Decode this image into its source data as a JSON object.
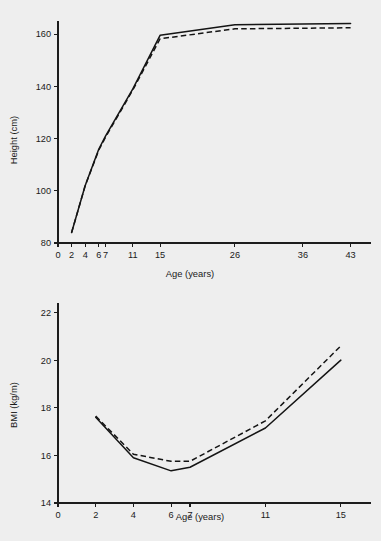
{
  "page": {
    "background_color": "#eeeeee",
    "ink_color": "#141414",
    "width": 381,
    "height": 541
  },
  "chart_data": [
    {
      "id": "height-chart",
      "type": "line",
      "title": "",
      "xlabel": "Age (years)",
      "ylabel": "Height (cm)",
      "xlim": [
        0,
        46
      ],
      "ylim": [
        80,
        165
      ],
      "xticks": [
        0,
        2,
        4,
        6,
        7,
        11,
        15,
        26,
        36,
        43
      ],
      "xticklabels": [
        "0",
        "2",
        "4",
        "6",
        "7",
        "11",
        "15",
        "26",
        "36",
        "43"
      ],
      "yticks": [
        80,
        100,
        120,
        140,
        160
      ],
      "yticklabels": [
        "80",
        "100",
        "120",
        "140",
        "160"
      ],
      "grid": false,
      "legend": "none",
      "series": [
        {
          "name": "solid",
          "style": "solid",
          "x": [
            2,
            4,
            6,
            7,
            11,
            15,
            26,
            43
          ],
          "values": [
            84.0,
            102.0,
            116.0,
            121.0,
            139.0,
            159.5,
            163.6,
            164.0
          ]
        },
        {
          "name": "dashed",
          "style": "dashed",
          "x": [
            2,
            4,
            6,
            7,
            11,
            15,
            26,
            43
          ],
          "values": [
            84.0,
            102.0,
            115.6,
            120.6,
            138.6,
            158.2,
            162.0,
            162.4
          ]
        }
      ]
    },
    {
      "id": "bmi-chart",
      "type": "line",
      "title": "",
      "xlabel": "Age (years)",
      "ylabel": "BMI (kg/m)",
      "xlim": [
        0,
        16.6
      ],
      "ylim": [
        14,
        22.4
      ],
      "xticks": [
        0,
        2,
        4,
        6,
        7,
        11,
        15
      ],
      "xticklabels": [
        "0",
        "2",
        "4",
        "6",
        "7",
        "11",
        "15"
      ],
      "yticks": [
        14,
        16,
        18,
        20,
        22
      ],
      "yticklabels": [
        "14",
        "16",
        "18",
        "20",
        "22"
      ],
      "grid": false,
      "legend": "none",
      "series": [
        {
          "name": "solid",
          "style": "solid",
          "x": [
            2,
            4,
            6,
            7,
            11,
            15
          ],
          "values": [
            17.6,
            15.9,
            15.35,
            15.5,
            17.15,
            20.0
          ]
        },
        {
          "name": "dashed",
          "style": "dashed",
          "x": [
            2,
            4,
            6,
            7,
            11,
            15
          ],
          "values": [
            17.65,
            16.05,
            15.75,
            15.75,
            17.45,
            20.6
          ]
        }
      ]
    }
  ]
}
